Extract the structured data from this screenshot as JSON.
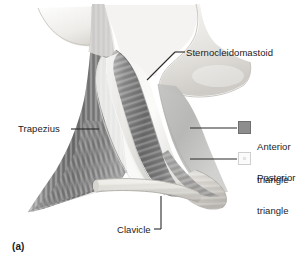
{
  "figure": {
    "panel_letter": "(a)",
    "labels": {
      "sternocleidomastoid": "Sternocleidomastoid",
      "trapezius": "Trapezius",
      "clavicle": "Clavicle"
    },
    "legend": {
      "items": [
        {
          "label_line1": "Anterior",
          "label_line2": "triangle",
          "swatch_color": "#8d8d8d",
          "swatch_border": "#6f6f6f"
        },
        {
          "label_line1": "Posterior",
          "label_line2": "triangle",
          "swatch_color": "#fbfbfb",
          "swatch_border": "#cfcfcf"
        }
      ]
    },
    "colors": {
      "background": "#ffffff",
      "text": "#1b1b1b",
      "leader_line": "#2a2a2a",
      "muscle_dark": "#6e6e6e",
      "muscle_mid": "#9a9a9a",
      "bone_light": "#f0efed",
      "skin_light": "#e2e2e0"
    }
  }
}
